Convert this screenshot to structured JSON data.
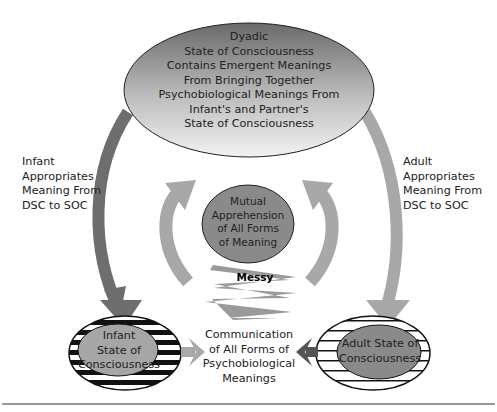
{
  "nodes": {
    "dyadic": {
      "lines": [
        "Dyadic",
        "State of Consciousness",
        "Contains Emergent Meanings",
        "From Bringing Together",
        "Psychobiological Meanings From",
        "Infant's and Partner's",
        "State of Consciousness"
      ]
    },
    "mutual": {
      "lines": [
        "Mutual",
        "Apprehension",
        "of All Forms",
        "of Meaning"
      ]
    },
    "infant": {
      "lines": [
        "Infant",
        "State of",
        "Consciousness"
      ]
    },
    "adult": {
      "lines": [
        "Adult State of",
        "Consciousness"
      ]
    }
  },
  "edges": {
    "left_label": [
      "Infant",
      "Appropriates",
      "Meaning From",
      "DSC to SOC"
    ],
    "right_label": [
      "Adult",
      "Appropriates",
      "Meaning From",
      "DSC to SOC"
    ],
    "messy": "Messy",
    "communication": [
      "Communication",
      "of All Forms of",
      "Psychobiological",
      "Meanings"
    ]
  },
  "colors": {
    "dark_arrow": "#6e6e6e",
    "light_arrow": "#a8a8a8",
    "mutual_fill": "#8a8a8a",
    "inner_fill": "#a6a6a6",
    "stripe": "#111111"
  }
}
